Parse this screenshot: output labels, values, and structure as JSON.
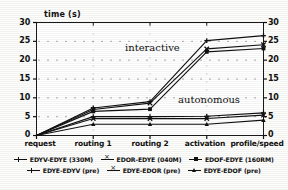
{
  "chart_data": {
    "type": "line",
    "title": "",
    "ylabel": "time (s)",
    "xlabel": "",
    "categories": [
      "request",
      "routing 1",
      "routing 2",
      "activation",
      "profile/speed"
    ],
    "ylim": [
      0,
      30
    ],
    "yticks": [
      0,
      5,
      10,
      15,
      20,
      25,
      30
    ],
    "yticks_right": [
      0,
      5,
      10,
      15,
      20,
      25,
      30
    ],
    "grid": true,
    "grid_style": "dotted",
    "legend_position": "below",
    "annotations": [
      {
        "text": "interactive",
        "x": "routing 2",
        "y": 21.5
      },
      {
        "text": "autonomous",
        "x": "activation",
        "y": 8.2
      }
    ],
    "series": [
      {
        "name": "EDYV-EDYE (330M)",
        "marker": "plus",
        "group": "interactive",
        "values": [
          0,
          7.3,
          9.0,
          25.2,
          26.5
        ]
      },
      {
        "name": "EDOR-EDYE (040M)",
        "marker": "cross",
        "group": "interactive",
        "values": [
          0,
          6.9,
          8.6,
          23.0,
          24.1
        ]
      },
      {
        "name": "EDOF-EDYE (160RM)",
        "marker": "square",
        "group": "interactive",
        "values": [
          0,
          6.4,
          7.0,
          22.2,
          23.1
        ]
      },
      {
        "name": "EDYE-EDYV (pre)",
        "marker": "plus",
        "group": "autonomous",
        "values": [
          0,
          5.0,
          5.0,
          5.1,
          6.0
        ]
      },
      {
        "name": "EDYE-EDOR (pre)",
        "marker": "cross",
        "group": "autonomous",
        "values": [
          0,
          4.5,
          4.5,
          4.5,
          5.4
        ]
      },
      {
        "name": "EDYE-EDOF (pre)",
        "marker": "triangle",
        "group": "autonomous",
        "values": [
          0,
          3.0,
          3.0,
          3.0,
          4.1
        ]
      }
    ]
  },
  "legend": {
    "row1": [
      {
        "label": "EDYV-EDYE (330M)",
        "marker": "plus"
      },
      {
        "label": "EDOR-EDYE (040M)",
        "marker": "cross"
      },
      {
        "label": "EDOF-EDYE (160RM)",
        "marker": "square"
      }
    ],
    "row2": [
      {
        "label": "EDYE-EDYV (pre)",
        "marker": "plus"
      },
      {
        "label": "EDYE-EDOR (pre)",
        "marker": "cross"
      },
      {
        "label": "EDYE-EDOF (pre)",
        "marker": "triangle"
      }
    ]
  },
  "colors": {
    "ink": "#111111",
    "paper": "#fdfdfb"
  }
}
